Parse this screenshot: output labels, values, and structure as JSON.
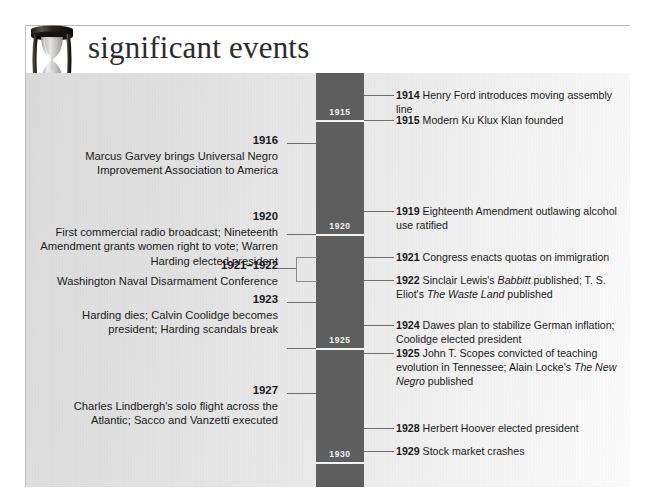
{
  "header": {
    "title": "significant events",
    "icon": "hourglass-icon"
  },
  "timeline": {
    "axis_label_color": "#f2f2f2",
    "bar_color": "#5e5e5e",
    "decade_marks": [
      {
        "year": "1915"
      },
      {
        "year": "1920"
      },
      {
        "year": "1925"
      },
      {
        "year": "1930"
      }
    ]
  },
  "left_events": [
    {
      "year": "1916",
      "text": "Marcus Garvey brings Universal Negro Improvement Association to America"
    },
    {
      "year": "1920",
      "text": "First commercial radio broadcast; Nineteenth Amendment grants women right to vote; Warren Harding elected president"
    },
    {
      "year": "1921–1922",
      "text": "Washington Naval Disarmament Conference"
    },
    {
      "year": "1923",
      "text": "Harding dies; Calvin Coolidge becomes president; Harding scandals break"
    },
    {
      "year": "1927",
      "text": "Charles Lindbergh's solo flight across the Atlantic; Sacco and Vanzetti executed"
    }
  ],
  "right_events": [
    {
      "year": "1914",
      "text": "Henry Ford introduces moving assembly line"
    },
    {
      "year": "1915",
      "text": "Modern Ku Klux Klan founded"
    },
    {
      "year": "1919",
      "text": "Eighteenth Amendment outlawing alcohol use ratified"
    },
    {
      "year": "1921",
      "text": "Congress enacts quotas on immigration"
    },
    {
      "year": "1922",
      "text": "Sinclair Lewis's Babbitt published; T. S. Eliot's The Waste Land published",
      "italics": [
        "Babbitt",
        "The Waste Land"
      ]
    },
    {
      "year": "1924",
      "text": "Dawes plan to stabilize German inflation; Coolidge elected president"
    },
    {
      "year": "1925",
      "text": "John T. Scopes convicted of teaching evolution in Tennessee; Alain Locke's The New Negro published",
      "italics": [
        "The New Negro"
      ]
    },
    {
      "year": "1928",
      "text": "Herbert Hoover elected president"
    },
    {
      "year": "1929",
      "text": "Stock market crashes"
    }
  ]
}
